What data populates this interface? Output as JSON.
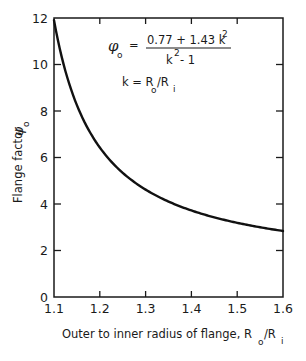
{
  "chart_data": {
    "type": "line",
    "title": "",
    "xlabel": "Outer to inner radius of flange, R_o/R_i",
    "ylabel": "Flange factor φ_o",
    "xlim": [
      1.1,
      1.6
    ],
    "ylim": [
      0,
      12
    ],
    "x_ticks": [
      1.1,
      1.2,
      1.3,
      1.4,
      1.5,
      1.6
    ],
    "x_tick_labels": [
      "1.1",
      "1.2",
      "1.3",
      "1.4",
      "1.5",
      "1.6"
    ],
    "y_ticks": [
      0,
      2,
      4,
      6,
      8,
      10,
      12
    ],
    "y_tick_labels": [
      "0",
      "2",
      "4",
      "6",
      "8",
      "10",
      "12"
    ],
    "grid": false,
    "legend": null,
    "series": [
      {
        "name": "φ_o = (0.77 + 1.43 k²)/(k² − 1)",
        "x": [
          1.1,
          1.15,
          1.2,
          1.25,
          1.3,
          1.35,
          1.4,
          1.45,
          1.5,
          1.55,
          1.6
        ],
        "values": [
          11.91,
          8.25,
          6.43,
          5.34,
          4.62,
          4.1,
          3.72,
          3.43,
          3.19,
          3.0,
          2.84
        ]
      }
    ],
    "annotations": [
      "φ_o = (0.77 + 1.43 k²) / (k² − 1)",
      "k = R_o / R_i"
    ]
  },
  "labels": {
    "y_axis_title": "Flange factor",
    "y_axis_symbol": "φ",
    "y_axis_symbol_sub": "o",
    "x_axis_title_prefix": "Outer to inner radius of flange, R",
    "x_axis_sub_o": "o",
    "x_axis_slash": "/R",
    "x_axis_sub_i": "i",
    "formula_lhs": "φ",
    "formula_lhs_sub": "o",
    "formula_eq": "=",
    "formula_numerator": "0.77 + 1.43 k",
    "formula_num_exp": "2",
    "formula_denominator_k": "k",
    "formula_den_exp": "2",
    "formula_denominator_rest": " - 1",
    "k_def_prefix": "k = R",
    "k_def_sub_o": "o",
    "k_def_slash": "/R",
    "k_def_sub_i": "i"
  },
  "style": {
    "line_color": "#111111",
    "axis_color": "#1a1a1a",
    "background": "#ffffff"
  }
}
